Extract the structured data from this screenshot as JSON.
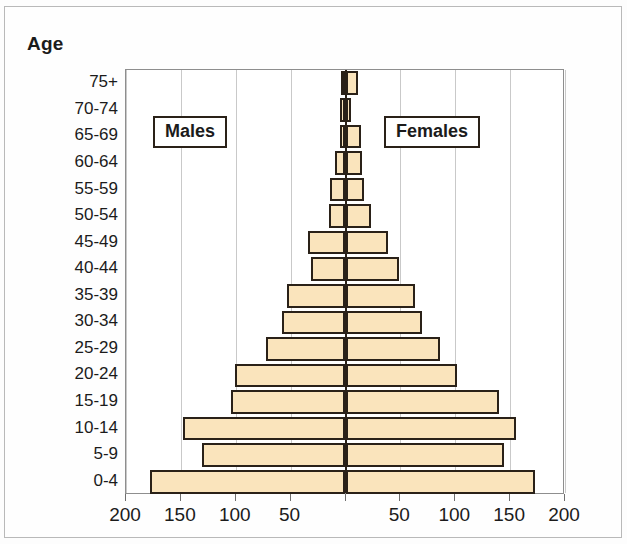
{
  "figure": {
    "axis_title": "Age"
  },
  "legend": {
    "males_label": "Males",
    "females_label": "Females"
  },
  "chart_data": {
    "type": "bar",
    "subtype": "population-pyramid",
    "title": "",
    "xlabel": "",
    "ylabel": "Age",
    "grid": true,
    "legend_position": "inside-plot",
    "orientation": "horizontal-diverging",
    "axis_max": 200,
    "x_tick_values": [
      200,
      150,
      100,
      50,
      0,
      50,
      100,
      150,
      200
    ],
    "x_tick_labels": [
      "200",
      "150",
      "100",
      "50",
      "",
      "50",
      "100",
      "150",
      "200"
    ],
    "categories": [
      "75+",
      "70-74",
      "65-69",
      "60-64",
      "55-59",
      "50-54",
      "45-49",
      "40-44",
      "35-39",
      "30-34",
      "25-29",
      "20-24",
      "15-19",
      "10-14",
      "5-9",
      "0-4"
    ],
    "series": [
      {
        "name": "Males",
        "side": "left",
        "color": "#fae4bc",
        "values": [
          4,
          5,
          5,
          10,
          14,
          15,
          34,
          31,
          53,
          58,
          72,
          101,
          104,
          148,
          131,
          178
        ]
      },
      {
        "name": "Females",
        "side": "right",
        "color": "#fae4bc",
        "values": [
          11,
          5,
          14,
          15,
          17,
          23,
          39,
          49,
          63,
          70,
          86,
          102,
          140,
          155,
          144,
          173
        ]
      }
    ]
  }
}
